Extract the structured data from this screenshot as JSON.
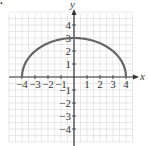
{
  "figure_label": ".",
  "chart_data": {
    "type": "line",
    "title": "",
    "xlabel": "x",
    "ylabel": "y",
    "xlim": [
      -5,
      4.5
    ],
    "ylim": [
      -5,
      5
    ],
    "grid": true,
    "grid_step": 0.5,
    "x_ticks": [
      -4,
      -3,
      -2,
      -1,
      1,
      2,
      3,
      4
    ],
    "x_tick_labels": [
      "−4",
      "−3",
      "−2",
      "−1",
      "1",
      "2",
      "3",
      "4"
    ],
    "y_ticks": [
      4,
      3,
      2,
      1,
      -1,
      -2,
      -3,
      -4
    ],
    "y_tick_labels": [
      "4",
      "3",
      "2",
      "1",
      "−1",
      "−2",
      "−3",
      "−4"
    ],
    "series": [
      {
        "name": "upper semi-ellipse",
        "equation": "x^2/16 + y^2/9 = 1, y >= 0",
        "x": [
          -4,
          -3.5,
          -3,
          -2,
          -1,
          0,
          1,
          2,
          3,
          3.5,
          4
        ],
        "y": [
          0,
          1.45,
          1.98,
          2.6,
          2.9,
          3,
          2.9,
          2.6,
          1.98,
          1.45,
          0
        ],
        "color": "#666666"
      }
    ]
  },
  "colors": {
    "curve": "#666666",
    "axis": "#333333",
    "grid": "#d8d8d8"
  }
}
